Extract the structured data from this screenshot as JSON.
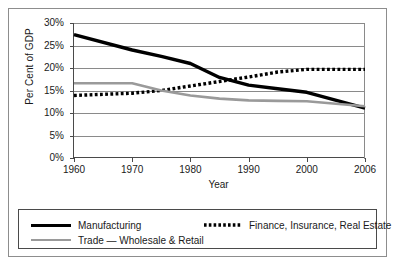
{
  "chart_data": {
    "type": "line",
    "title": "",
    "xlabel": "Year",
    "ylabel": "Per Cent of GDP",
    "categories": [
      "1960",
      "1970",
      "1980",
      "1990",
      "2000",
      "2006"
    ],
    "x_tick_labels": [
      "1960",
      "1970",
      "1980",
      "1990",
      "2000",
      "2006"
    ],
    "y_tick_labels": [
      "0%",
      "5%",
      "10%",
      "15%",
      "20%",
      "25%",
      "30%"
    ],
    "y_tick_values": [
      0,
      5,
      10,
      15,
      20,
      25,
      30
    ],
    "ylim": [
      0,
      30
    ],
    "grid": "horizontal",
    "legend_position": "below-plot",
    "series": [
      {
        "name": "Manufacturing",
        "style": "solid",
        "color": "#000000",
        "width": 3.4,
        "values": [
          27.4,
          24.0,
          21.0,
          16.2,
          14.6,
          11.1
        ],
        "points": [
          {
            "x": 1960,
            "y": 27.4
          },
          {
            "x": 1970,
            "y": 24.0
          },
          {
            "x": 1975,
            "y": 22.6
          },
          {
            "x": 1980,
            "y": 21.0
          },
          {
            "x": 1985,
            "y": 17.9
          },
          {
            "x": 1990,
            "y": 16.2
          },
          {
            "x": 1995,
            "y": 15.4
          },
          {
            "x": 2000,
            "y": 14.6
          },
          {
            "x": 2006,
            "y": 11.1
          }
        ]
      },
      {
        "name": "Finance, Insurance, Real Estate",
        "style": "dotted",
        "color": "#000000",
        "width": 3.4,
        "values": [
          13.9,
          14.4,
          16.0,
          18.0,
          19.7,
          19.7
        ],
        "points": [
          {
            "x": 1960,
            "y": 13.9
          },
          {
            "x": 1970,
            "y": 14.4
          },
          {
            "x": 1975,
            "y": 15.0
          },
          {
            "x": 1980,
            "y": 16.0
          },
          {
            "x": 1985,
            "y": 17.0
          },
          {
            "x": 1990,
            "y": 18.0
          },
          {
            "x": 1995,
            "y": 19.1
          },
          {
            "x": 2000,
            "y": 19.7
          },
          {
            "x": 2006,
            "y": 19.7
          }
        ]
      },
      {
        "name": "Trade — Wholesale & Retail",
        "style": "solid",
        "color": "#9a9a9a",
        "width": 2.6,
        "values": [
          16.6,
          16.6,
          13.9,
          12.8,
          12.6,
          11.5
        ],
        "points": [
          {
            "x": 1960,
            "y": 16.6
          },
          {
            "x": 1970,
            "y": 16.6
          },
          {
            "x": 1975,
            "y": 15.0
          },
          {
            "x": 1980,
            "y": 13.9
          },
          {
            "x": 1985,
            "y": 13.2
          },
          {
            "x": 1990,
            "y": 12.8
          },
          {
            "x": 1995,
            "y": 12.7
          },
          {
            "x": 2000,
            "y": 12.6
          },
          {
            "x": 2006,
            "y": 11.5
          }
        ]
      }
    ]
  },
  "legend": {
    "entries": [
      {
        "label": "Manufacturing",
        "style": "solid",
        "color": "#000000"
      },
      {
        "label": "Finance, Insurance, Real Estate",
        "style": "dotted",
        "color": "#000000"
      },
      {
        "label": "Trade — Wholesale & Retail",
        "style": "solid",
        "color": "#9a9a9a"
      }
    ]
  },
  "colors": {
    "frame": "#8d8d8d",
    "axis": "#4a4a4a",
    "gridline": "#8a8a8a",
    "manufacturing": "#000000",
    "finance": "#000000",
    "trade": "#9a9a9a",
    "background": "#ffffff"
  }
}
